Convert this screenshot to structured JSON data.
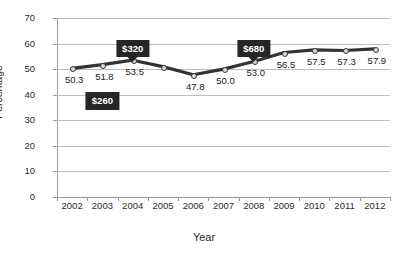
{
  "chart_data": {
    "type": "line",
    "title": "",
    "xlabel": "Year",
    "ylabel": "Percentage",
    "categories": [
      "2002",
      "2003",
      "2004",
      "2005",
      "2006",
      "2007",
      "2008",
      "2009",
      "2010",
      "2011",
      "2012"
    ],
    "values": [
      50.3,
      51.8,
      53.5,
      51.0,
      47.8,
      50.0,
      53.0,
      56.5,
      57.5,
      57.3,
      57.9
    ],
    "point_labels": [
      "50.3",
      "51.8",
      "53.5",
      "",
      "47.8",
      "50.0",
      "53.0",
      "56.5",
      "57.5",
      "57.3",
      "57.9"
    ],
    "ylim": [
      0,
      70
    ],
    "yticks": [
      "0",
      "10",
      "20",
      "30",
      "40",
      "50",
      "60",
      "70"
    ],
    "grid": true,
    "legend": "none",
    "series_color": "#333333",
    "grid_color": "#bfbfbf",
    "annotations": [
      {
        "text": "$260",
        "year": "2003",
        "value": 37.5,
        "pointer": false
      },
      {
        "text": "$320",
        "year": "2004",
        "value": 58.0,
        "pointer": true
      },
      {
        "text": "$680",
        "year": "2008",
        "value": 58.0,
        "pointer": true
      }
    ]
  }
}
